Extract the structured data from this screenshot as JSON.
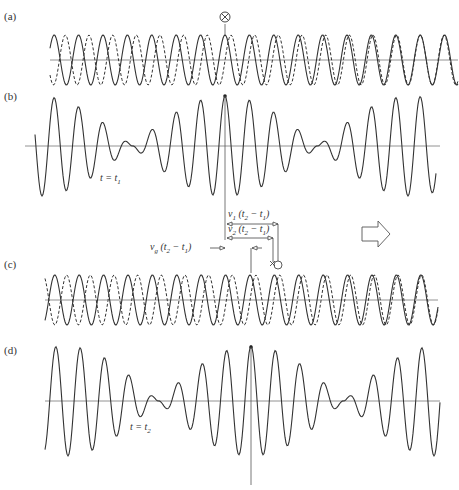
{
  "panels": {
    "a": {
      "label": "(a)",
      "axis_y": 60,
      "x0": 50,
      "x1": 458,
      "amp": 25,
      "period": 24.4,
      "phase_ref_x": 225,
      "dashed_shift": 6
    },
    "b": {
      "label": "(b)",
      "axis_y": 146,
      "x0": 35,
      "x1": 436,
      "amp": 50,
      "period": 24.4,
      "envelope_center_x": 225,
      "beat_half_period": 93,
      "time_label": "t = t1",
      "time_label_text": "t = ",
      "time_label_sub": "1"
    },
    "c": {
      "label": "(c)",
      "axis_y": 300,
      "x0": 45,
      "x1": 438,
      "amp": 25,
      "period": 24.4,
      "phase_ref_x": 250,
      "dashed_shift": 6
    },
    "d": {
      "label": "(d)",
      "axis_y": 401,
      "x0": 45,
      "x1": 440,
      "amp": 55,
      "period": 24.4,
      "envelope_center_x": 251,
      "beat_half_period": 93,
      "time_label": "t = t2",
      "time_label_text": "t = ",
      "time_label_sub": "2"
    }
  },
  "markers": {
    "top_crossed_circle": {
      "x": 225,
      "y": 17,
      "glyph": "⊗"
    },
    "moved_circle": {
      "x": 276,
      "y": 265
    },
    "group_peak_b": {
      "x": 225,
      "y": 96
    },
    "group_peak_d": {
      "x": 251,
      "y": 347
    }
  },
  "annotations": {
    "v1": {
      "text": "v",
      "sub": "1",
      "rest": " (t",
      "sub2": "2",
      "mid": " − t",
      "sub3": "1",
      "end": ")"
    },
    "v2": {
      "text": "v",
      "sub": "2",
      "rest": " (t",
      "sub2": "2",
      "mid": " − t",
      "sub3": "1",
      "end": ")"
    },
    "vg": {
      "text": "v",
      "sub": "g",
      "rest": " (t",
      "sub2": "2",
      "mid": " − t",
      "sub3": "1",
      "end": ")"
    }
  },
  "direction_arrow": {
    "x": 362,
    "y": 222,
    "direction": "right"
  },
  "colors": {
    "stroke": "#333333",
    "axis": "#666666",
    "background": "#ffffff"
  }
}
